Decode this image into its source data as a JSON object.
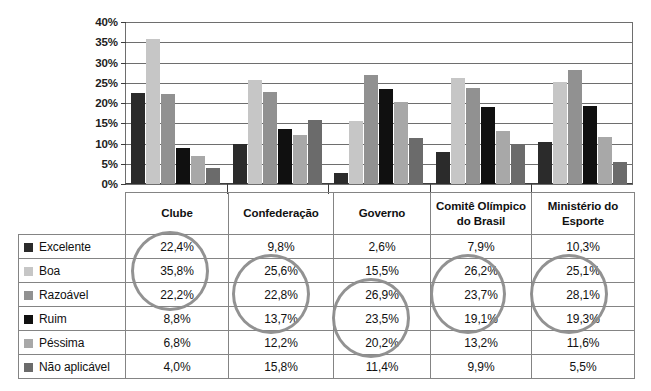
{
  "chart_data": {
    "type": "bar",
    "title": "",
    "xlabel": "",
    "ylabel": "",
    "ylim": [
      0,
      40
    ],
    "grid": true,
    "legend_position": "table-left-column",
    "ytick_labels": [
      "40%",
      "35%",
      "30%",
      "25%",
      "20%",
      "15%",
      "10%",
      "5%",
      "0%"
    ],
    "ytick_values": [
      40,
      35,
      30,
      25,
      20,
      15,
      10,
      5,
      0
    ],
    "categories": [
      "Clube",
      "Confederação",
      "Governo",
      "Comitê Olímpico do Brasil",
      "Ministério do Esporte"
    ],
    "series": [
      {
        "name": "Excelente",
        "color": "#2b2b2b",
        "values": [
          22.4,
          9.8,
          2.6,
          7.9,
          10.3
        ],
        "labels": [
          "22,4%",
          "9,8%",
          "2,6%",
          "7,9%",
          "10,3%"
        ]
      },
      {
        "name": "Boa",
        "color": "#c6c6c6",
        "values": [
          35.8,
          25.6,
          15.5,
          26.2,
          25.1
        ],
        "labels": [
          "35,8%",
          "25,6%",
          "15,5%",
          "26,2%",
          "25,1%"
        ]
      },
      {
        "name": "Razoável",
        "color": "#919191",
        "values": [
          22.2,
          22.8,
          26.9,
          23.7,
          28.1
        ],
        "labels": [
          "22,2%",
          "22,8%",
          "26,9%",
          "23,7%",
          "28,1%"
        ]
      },
      {
        "name": "Ruim",
        "color": "#101010",
        "values": [
          8.8,
          13.7,
          23.5,
          19.1,
          19.3
        ],
        "labels": [
          "8,8%",
          "13,7%",
          "23,5%",
          "19,1%",
          "19,3%"
        ]
      },
      {
        "name": "Péssima",
        "color": "#a8a8a8",
        "values": [
          6.8,
          12.2,
          20.2,
          13.2,
          11.6
        ],
        "labels": [
          "6,8%",
          "12,2%",
          "20,2%",
          "13,2%",
          "11,6%"
        ]
      },
      {
        "name": "Não aplicável",
        "color": "#6b6b6b",
        "values": [
          4.0,
          15.8,
          11.4,
          9.9,
          5.5
        ],
        "labels": [
          "4,0%",
          "15,8%",
          "11,4%",
          "9,9%",
          "5,5%"
        ]
      }
    ]
  },
  "table": {
    "legend_header": "",
    "columns": [
      "Clube",
      "Confederação",
      "Governo",
      "Comitê Olímpico do Brasil",
      "Ministério do Esporte"
    ],
    "rows": [
      {
        "label": "Excelente",
        "swatch": "#2b2b2b",
        "values": [
          "22,4%",
          "9,8%",
          "2,6%",
          "7,9%",
          "10,3%"
        ]
      },
      {
        "label": "Boa",
        "swatch": "#c6c6c6",
        "values": [
          "35,8%",
          "25,6%",
          "15,5%",
          "26,2%",
          "25,1%"
        ]
      },
      {
        "label": "Razoável",
        "swatch": "#919191",
        "values": [
          "22,2%",
          "22,8%",
          "26,9%",
          "23,7%",
          "28,1%"
        ]
      },
      {
        "label": "Ruim",
        "swatch": "#101010",
        "values": [
          "8,8%",
          "13,7%",
          "23,5%",
          "19,1%",
          "19,3%"
        ]
      },
      {
        "label": "Péssima",
        "swatch": "#a8a8a8",
        "values": [
          "6,8%",
          "12,2%",
          "20,2%",
          "13,2%",
          "11,6%"
        ]
      },
      {
        "label": "Não aplicável",
        "swatch": "#6b6b6b",
        "values": [
          "4,0%",
          "15,8%",
          "11,4%",
          "9,9%",
          "5,5%"
        ]
      }
    ]
  },
  "annotations": {
    "color": "#8c8c8c",
    "ellipses": [
      {
        "name": "highlight-clube",
        "column": "Clube",
        "rows": [
          "Excelente",
          "Boa",
          "Razoável"
        ],
        "left": 113,
        "top": 39,
        "width": 78,
        "height": 80
      },
      {
        "name": "highlight-confed",
        "column": "Confederação",
        "rows": [
          "Boa",
          "Razoável",
          "Ruim"
        ],
        "left": 214,
        "top": 62,
        "width": 78,
        "height": 80
      },
      {
        "name": "highlight-governo",
        "column": "Governo",
        "rows": [
          "Razoável",
          "Ruim",
          "Péssima"
        ],
        "left": 314,
        "top": 86,
        "width": 78,
        "height": 80
      },
      {
        "name": "highlight-cob",
        "column": "Comitê Olímpico do Brasil",
        "rows": [
          "Boa",
          "Razoável",
          "Ruim"
        ],
        "left": 412,
        "top": 62,
        "width": 76,
        "height": 80
      },
      {
        "name": "highlight-ministerio",
        "column": "Ministério do Esporte",
        "rows": [
          "Boa",
          "Razoável",
          "Ruim"
        ],
        "left": 512,
        "top": 62,
        "width": 78,
        "height": 80
      }
    ]
  }
}
